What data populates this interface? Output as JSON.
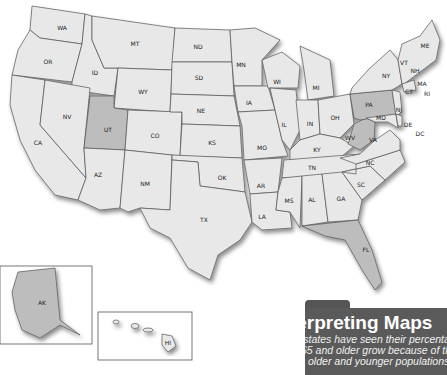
{
  "map": {
    "title": "United States",
    "highlight_color": "#bdbdbd",
    "base_color": "#e8e8e8",
    "highlighted_states": [
      "UT",
      "PA",
      "WV",
      "FL"
    ],
    "state_labels": [
      "WA",
      "OR",
      "CA",
      "ID",
      "NV",
      "MT",
      "WY",
      "UT",
      "AZ",
      "CO",
      "NM",
      "ND",
      "SD",
      "NE",
      "KS",
      "OK",
      "TX",
      "MN",
      "IA",
      "MO",
      "AR",
      "LA",
      "WI",
      "IL",
      "MI",
      "IN",
      "OH",
      "KY",
      "TN",
      "MS",
      "AL",
      "GA",
      "FL",
      "SC",
      "NC",
      "VA",
      "WV",
      "PA",
      "NY",
      "MD",
      "DE",
      "DC",
      "NJ",
      "CT",
      "RI",
      "MA",
      "VT",
      "NH",
      "ME",
      "AK",
      "HI"
    ]
  },
  "labels": {
    "WA": "WA",
    "OR": "OR",
    "CA": "CA",
    "ID": "ID",
    "NV": "NV",
    "MT": "MT",
    "WY": "WY",
    "UT": "UT",
    "AZ": "AZ",
    "CO": "CO",
    "NM": "NM",
    "ND": "ND",
    "SD": "SD",
    "NE": "NE",
    "KS": "KS",
    "OK": "OK",
    "TX": "TX",
    "MN": "MN",
    "IA": "IA",
    "MO": "MO",
    "AR": "AR",
    "LA": "LA",
    "WI": "WI",
    "IL": "IL",
    "MI": "MI",
    "IN": "IN",
    "OH": "OH",
    "KY": "KY",
    "TN": "TN",
    "MS": "MS",
    "AL": "AL",
    "GA": "GA",
    "FL": "FL",
    "SC": "SC",
    "NC": "NC",
    "VA": "VA",
    "WV": "WV",
    "PA": "PA",
    "NY": "NY",
    "MD": "MD",
    "DE": "DE",
    "DC": "DC",
    "NJ": "NJ",
    "CT": "CT",
    "RI": "RI",
    "MA": "MA",
    "VT": "VT",
    "NH": "NH",
    "ME": "ME",
    "AK": "AK",
    "HI": "HI"
  },
  "panel": {
    "title": "Interpreting Maps",
    "line1": "Some states have seen their percentage of popu-",
    "line2": "lation 65 and older grow because of the movement",
    "line3": "of both older and younger populations."
  }
}
